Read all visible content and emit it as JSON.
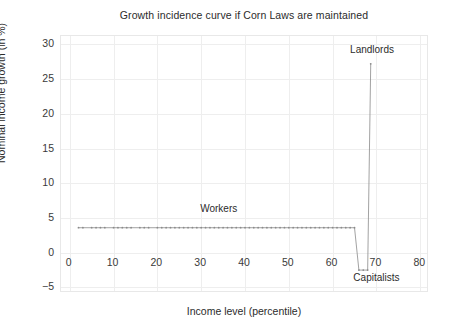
{
  "chart_data": {
    "type": "line",
    "title": "Growth incidence curve if Corn Laws are maintained",
    "xlabel": "Income level (percentile)",
    "ylabel": "Nominal income growth (in %)",
    "xlim": [
      -2,
      82
    ],
    "ylim": [
      -5.8,
      31.2
    ],
    "xticks": [
      0,
      10,
      20,
      30,
      40,
      50,
      60,
      70,
      80
    ],
    "xtick_labels": [
      "0",
      "10",
      "20",
      "30",
      "40",
      "50",
      "60",
      "70",
      "80"
    ],
    "yticks": [
      -5,
      0,
      5,
      10,
      15,
      20,
      25,
      30
    ],
    "ytick_labels": [
      "−5",
      "0",
      "5",
      "10",
      "15",
      "20",
      "25",
      "30"
    ],
    "grid": true,
    "legend": "none",
    "marker": "dot",
    "line_color": "#8a8a8a",
    "marker_color": "#8a8a8a",
    "annotations": [
      {
        "text": "Workers",
        "x": 34,
        "y": 6.3
      },
      {
        "text": "Landlords",
        "x": 69,
        "y": 29.2
      },
      {
        "text": "Capitalists",
        "x": 70,
        "y": -3.6
      }
    ],
    "x": [
      2,
      3,
      5,
      6,
      7,
      8,
      10,
      11,
      12,
      13,
      14,
      16,
      17,
      18,
      20,
      21,
      22,
      23,
      24,
      25,
      26,
      27,
      28,
      29,
      30,
      31,
      32,
      33,
      34,
      35,
      36,
      37,
      38,
      39,
      40,
      41,
      42,
      43,
      44,
      45,
      46,
      47,
      48,
      49,
      50,
      51,
      52,
      53,
      54,
      55,
      56,
      57,
      58,
      59,
      60,
      61,
      62,
      63,
      64,
      65,
      66,
      67,
      68,
      68.7
    ],
    "y": [
      3.6,
      3.6,
      3.6,
      3.6,
      3.6,
      3.6,
      3.6,
      3.6,
      3.6,
      3.6,
      3.6,
      3.6,
      3.6,
      3.6,
      3.6,
      3.6,
      3.6,
      3.6,
      3.6,
      3.6,
      3.6,
      3.6,
      3.6,
      3.6,
      3.6,
      3.6,
      3.6,
      3.6,
      3.6,
      3.6,
      3.6,
      3.6,
      3.6,
      3.6,
      3.6,
      3.6,
      3.6,
      3.6,
      3.6,
      3.6,
      3.6,
      3.6,
      3.6,
      3.6,
      3.6,
      3.6,
      3.6,
      3.6,
      3.6,
      3.6,
      3.6,
      3.6,
      3.6,
      3.6,
      3.6,
      3.6,
      3.6,
      3.6,
      3.6,
      3.6,
      -2.5,
      -2.5,
      -2.5,
      27.2
    ]
  }
}
